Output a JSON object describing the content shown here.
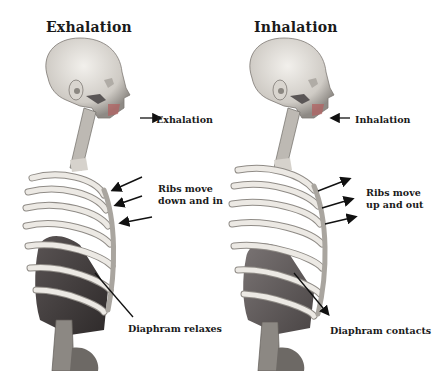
{
  "panels": [
    {
      "id": "exhalation",
      "title": "Exhalation",
      "labels": {
        "airflow": "Exhalation",
        "ribs_line1": "Ribs move",
        "ribs_line2": "down and in",
        "diaphragm": "Diaphram relaxes"
      },
      "arrow_directions": {
        "airflow": "right (away from mouth)",
        "ribs": "pointing inward toward rib cage",
        "diaphragm": "pointing up-left toward diaphragm"
      }
    },
    {
      "id": "inhalation",
      "title": "Inhalation",
      "labels": {
        "airflow": "Inhalation",
        "ribs_line1": "Ribs move",
        "ribs_line2": "up and out",
        "diaphragm": "Diaphram contacts"
      },
      "arrow_directions": {
        "airflow": "left (toward mouth)",
        "ribs": "pointing outward away from rib cage",
        "diaphragm": "pointing down-right away from diaphragm"
      }
    }
  ],
  "colors": {
    "background": "#ffffff",
    "text": "#1a1a1a",
    "bone": "#e4e1dc",
    "bone_shadow": "#9c9892",
    "diaphragm_dark": "#3f3b3b",
    "diaphragm_light": "#6e6868",
    "arrow": "#111111"
  }
}
